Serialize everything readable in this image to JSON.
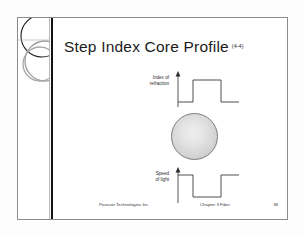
{
  "slide": {
    "title": "Step Index Core Profile",
    "title_figure_reference": "(4-4)",
    "logo": {
      "icon": "overlapping-circles-logo"
    },
    "diagram": {
      "upper_plot": {
        "label_line1": "Index of",
        "label_line2": "refraction",
        "waveform": "step-up-pulse",
        "axis_icon": "up-arrow-axis"
      },
      "core": {
        "icon": "fiber-core-circle"
      },
      "lower_plot": {
        "label_line1": "Speed",
        "label_line2": "of light",
        "waveform": "step-down-pulse",
        "axis_icon": "up-arrow-axis"
      }
    },
    "footer": {
      "company": "Pearson Technologies Inc.",
      "chapter": "Chapter 3 Fiber",
      "page_number": "38"
    }
  }
}
